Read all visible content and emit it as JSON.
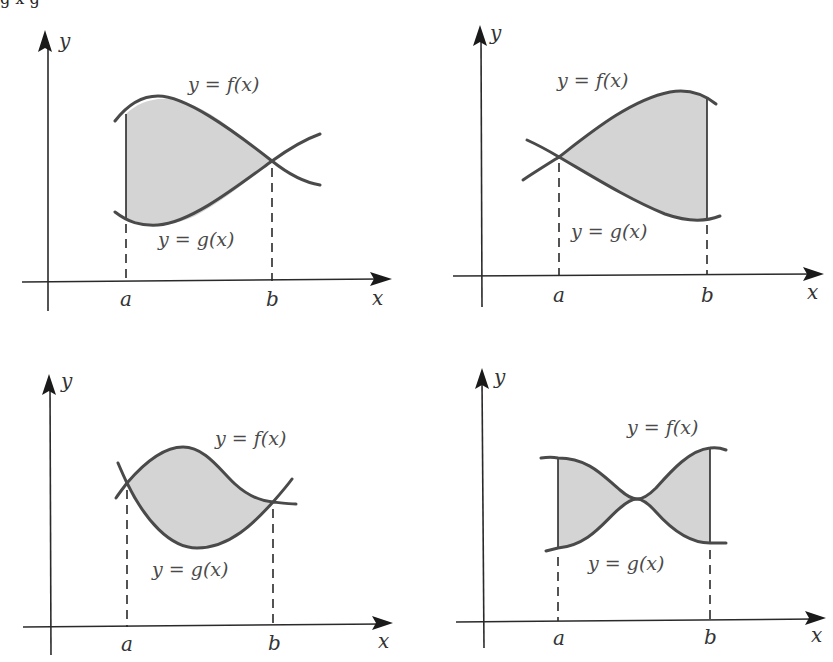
{
  "figure": {
    "caption_partial": "g     x  g",
    "panels": [
      {
        "id": "top-left",
        "x_axis_label": "x",
        "y_axis_label": "y",
        "a_label": "a",
        "b_label": "b",
        "f_label": "y = f(x)",
        "g_label": "y = g(x)",
        "description": "f above g on [a,b]; curves intersect at x=b; vertical boundary at x=a"
      },
      {
        "id": "top-right",
        "x_axis_label": "x",
        "y_axis_label": "y",
        "a_label": "a",
        "b_label": "b",
        "f_label": "y = f(x)",
        "g_label": "y = g(x)",
        "description": "curves intersect at x=a; f above g; vertical boundary at x=b"
      },
      {
        "id": "bottom-left",
        "x_axis_label": "x",
        "y_axis_label": "y",
        "a_label": "a",
        "b_label": "b",
        "f_label": "y = f(x)",
        "g_label": "y = g(x)",
        "description": "curves intersect at both x=a and x=b"
      },
      {
        "id": "bottom-right",
        "x_axis_label": "x",
        "y_axis_label": "y",
        "a_label": "a",
        "b_label": "b",
        "f_label": "y = f(x)",
        "g_label": "y = g(x)",
        "description": "curves touch in the middle (bow-tie); vertical boundaries at x=a and x=b"
      }
    ],
    "colors": {
      "region_fill": "#d4d4d4",
      "curve": "#4a4a4a",
      "axis": "#2a2a2a",
      "label": "#4a4a4a"
    }
  }
}
